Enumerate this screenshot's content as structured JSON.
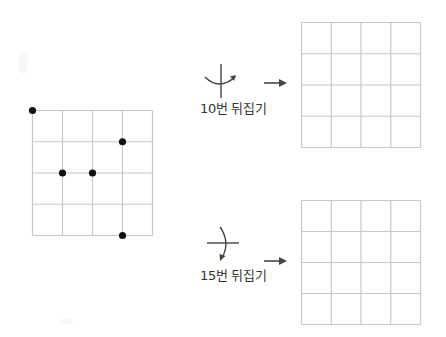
{
  "figure": {
    "colors": {
      "grid_line": "#c8c8c8",
      "dot": "#111111",
      "arrow": "#444444",
      "text": "#333333"
    }
  },
  "source_grid": {
    "rows": 4,
    "cols": 4,
    "dots": [
      {
        "col": 0,
        "row": 0
      },
      {
        "col": 3,
        "row": 1
      },
      {
        "col": 1,
        "row": 2
      },
      {
        "col": 2,
        "row": 2
      },
      {
        "col": 3,
        "row": 4
      }
    ]
  },
  "operations": [
    {
      "label": "10번 뒤집기",
      "axis": "vertical",
      "axis_icon": "flip-horizontal-icon",
      "arrow_icon": "arrow-right-icon",
      "result_grid": {
        "rows": 4,
        "cols": 4,
        "dots": []
      }
    },
    {
      "label": "15번 뒤집기",
      "axis": "horizontal",
      "axis_icon": "flip-vertical-icon",
      "arrow_icon": "arrow-right-icon",
      "result_grid": {
        "rows": 4,
        "cols": 4,
        "dots": []
      }
    }
  ]
}
